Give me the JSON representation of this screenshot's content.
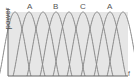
{
  "diagram": {
    "ylabel": "power",
    "xlabel": "f",
    "labels": [
      {
        "text": "A",
        "x": 30
      },
      {
        "text": "B",
        "x": 56
      },
      {
        "text": "C",
        "x": 83
      },
      {
        "text": "A",
        "x": 110
      }
    ],
    "curve_peaks_x": [
      15,
      29,
      43,
      56,
      69,
      83,
      97,
      110,
      123
    ],
    "curve_color": "#8a8a8a",
    "fill_color": "#e6e6e6"
  }
}
